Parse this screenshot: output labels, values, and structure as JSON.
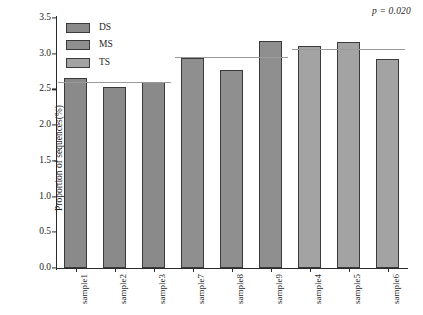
{
  "annotation": {
    "p_value_text": "p = 0.020"
  },
  "axes": {
    "ylabel": "Proportion of sequences(%)",
    "xlabel": "",
    "yticks": [
      "0.0",
      "0.5",
      "1.0",
      "1.5",
      "2.0",
      "2.5",
      "3.0",
      "3.5"
    ],
    "ylim": [
      0.0,
      3.5
    ]
  },
  "legend": {
    "position": "upper-left",
    "items": [
      {
        "label": "DS",
        "color": "#8a8a8a"
      },
      {
        "label": "MS",
        "color": "#8f8f8f"
      },
      {
        "label": "TS",
        "color": "#a3a3a3"
      }
    ]
  },
  "chart_data": {
    "type": "bar",
    "title": "",
    "xlabel": "",
    "ylabel": "Proportion of sequences(%)",
    "ylim": [
      0.0,
      3.5
    ],
    "grid": false,
    "legend_position": "upper-left",
    "categories": [
      "sample1",
      "sample2",
      "sample3",
      "sample7",
      "sample8",
      "sample9",
      "sample4",
      "sample5",
      "sample6"
    ],
    "values": [
      2.66,
      2.54,
      2.61,
      2.94,
      2.77,
      3.18,
      3.11,
      3.17,
      2.93
    ],
    "groups": [
      "DS",
      "DS",
      "DS",
      "MS",
      "MS",
      "MS",
      "TS",
      "TS",
      "TS"
    ],
    "group_colors": {
      "DS": "#8a8a8a",
      "MS": "#8f8f8f",
      "TS": "#a3a3a3"
    },
    "reference_lines": [
      {
        "group": "DS",
        "value": 2.61,
        "start_index": 0,
        "end_index": 2
      },
      {
        "group": "MS",
        "value": 2.96,
        "start_index": 3,
        "end_index": 5
      },
      {
        "group": "TS",
        "value": 3.07,
        "start_index": 6,
        "end_index": 8
      }
    ],
    "annotations": [
      {
        "text": "p = 0.020",
        "position": "top-right"
      }
    ]
  }
}
